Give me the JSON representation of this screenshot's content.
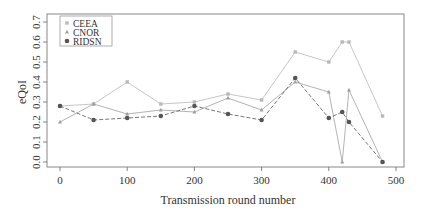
{
  "chart_data": {
    "type": "line",
    "title": "",
    "xlabel": "Transmission round number",
    "ylabel": "eQoI",
    "xlim": [
      -10,
      520
    ],
    "ylim": [
      -0.02,
      0.72
    ],
    "x_ticks": [
      0,
      100,
      200,
      300,
      400,
      500
    ],
    "y_ticks": [
      0.0,
      0.1,
      0.2,
      0.3,
      0.4,
      0.5,
      0.6,
      0.7
    ],
    "y_tick_labels": [
      "0.0",
      "0.1",
      "0.2",
      "0.3",
      "0.4",
      "0.5",
      "0.6",
      "0.7"
    ],
    "grid": false,
    "legend_position": "top-left",
    "x": [
      0,
      50,
      100,
      150,
      200,
      250,
      300,
      350,
      400,
      420,
      430,
      480
    ],
    "series": [
      {
        "name": "CEEA",
        "marker": "square",
        "color": "#b8b8b8",
        "line_style": "solid",
        "values": [
          0.28,
          0.29,
          0.4,
          0.29,
          0.3,
          0.34,
          0.31,
          0.55,
          0.5,
          0.6,
          0.6,
          0.23
        ]
      },
      {
        "name": "CNOR",
        "marker": "triangle",
        "color": "#a0a0a0",
        "line_style": "solid",
        "values": [
          0.2,
          0.29,
          0.24,
          0.26,
          0.25,
          0.32,
          0.26,
          0.4,
          0.35,
          0.0,
          0.36,
          0.0
        ]
      },
      {
        "name": "RIDSN",
        "marker": "circle",
        "color": "#555555",
        "line_style": "dashed",
        "values": [
          0.28,
          0.21,
          0.22,
          0.23,
          0.28,
          0.24,
          0.21,
          0.42,
          0.22,
          0.25,
          0.2,
          0.0
        ]
      }
    ]
  }
}
